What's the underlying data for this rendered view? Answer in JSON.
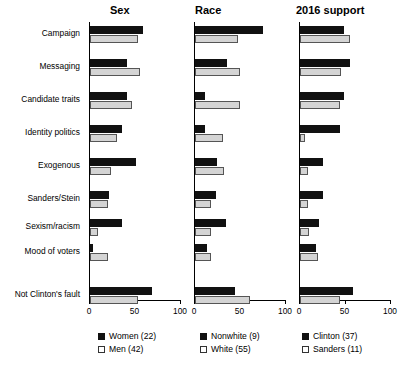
{
  "chart_data": {
    "type": "bar",
    "orientation": "horizontal",
    "title": "",
    "xlabel": "",
    "ylabel": "",
    "xlim": [
      0,
      100
    ],
    "xticks": [
      0,
      50,
      100
    ],
    "xtick_labels": [
      "0",
      "50",
      "100"
    ],
    "grid": false,
    "legend_position": "bottom",
    "categories": [
      "Campaign",
      "Messaging",
      "Candidate traits",
      "Identity politics",
      "Exogenous",
      "Sanders/Stein",
      "Sexism/racism",
      "Mood of voters",
      "Not Clinton's fault"
    ],
    "panels": [
      {
        "title": "Sex",
        "series": [
          {
            "name": "Women (22)",
            "style": "dark",
            "values": [
              58,
              41,
              41,
              35,
              51,
              21,
              35,
              3,
              68
            ]
          },
          {
            "name": "Men (42)",
            "style": "light",
            "values": [
              53,
              55,
              46,
              30,
              23,
              20,
              9,
              20,
              53
            ]
          }
        ]
      },
      {
        "title": "Race",
        "series": [
          {
            "name": "Nonwhite (9)",
            "style": "dark",
            "values": [
              75,
              35,
              11,
              11,
              24,
              23,
              34,
              13,
              44
            ]
          },
          {
            "name": "White (55)",
            "style": "light",
            "values": [
              47,
              49,
              49,
              31,
              32,
              18,
              18,
              18,
              60
            ]
          }
        ]
      },
      {
        "title": "2016 support",
        "series": [
          {
            "name": "Clinton (37)",
            "style": "dark",
            "values": [
              48,
              55,
              48,
              44,
              25,
              25,
              21,
              18,
              58
            ]
          },
          {
            "name": "Sanders (11)",
            "style": "light",
            "values": [
              55,
              45,
              44,
              5,
              9,
              9,
              10,
              20,
              44
            ]
          }
        ]
      }
    ]
  },
  "legend": {
    "columns": [
      {
        "entries": [
          {
            "label": "Women (22)",
            "style": "dark"
          },
          {
            "label": "Men (42)",
            "style": "light"
          }
        ]
      },
      {
        "entries": [
          {
            "label": "Nonwhite (9)",
            "style": "dark"
          },
          {
            "label": "White (55)",
            "style": "light"
          }
        ]
      },
      {
        "entries": [
          {
            "label": "Clinton (37)",
            "style": "dark"
          },
          {
            "label": "Sanders (11)",
            "style": "light"
          }
        ]
      }
    ]
  }
}
